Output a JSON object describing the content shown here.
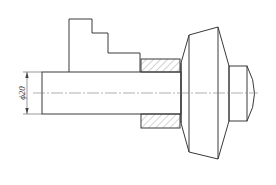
{
  "drawing": {
    "subject": "lathe chuck holding shaft workpiece",
    "dimension": {
      "label": "ϕ20",
      "kind": "diameter"
    },
    "colors": {
      "line": "#3a3a3a",
      "centerline": "#7a7a7a",
      "background": "#ffffff"
    }
  }
}
